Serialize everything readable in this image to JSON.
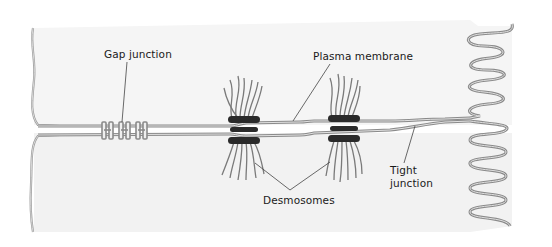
{
  "diagram": {
    "labels": {
      "gap_junction": "Gap junction",
      "plasma_membrane": "Plasma membrane",
      "desmosomes": "Desmosomes",
      "tight_junction_line1": "Tight",
      "tight_junction_line2": "junction"
    },
    "colors": {
      "background": "#ffffff",
      "cell_fill": "#f4f4f4",
      "membrane_stroke": "#8a8a8a",
      "membrane_inner": "#d8d8d8",
      "desmosome_plaque": "#2a2a2a",
      "filament": "#7a7a7a",
      "label_text": "#1a1a1a",
      "leader_line": "#444444"
    },
    "structures": [
      {
        "name": "Gap junction",
        "count_channels": 3
      },
      {
        "name": "Desmosomes",
        "count": 2
      },
      {
        "name": "Plasma membrane"
      },
      {
        "name": "Tight junction"
      },
      {
        "name": "Microvilli (folded membrane, right edge)"
      }
    ]
  }
}
